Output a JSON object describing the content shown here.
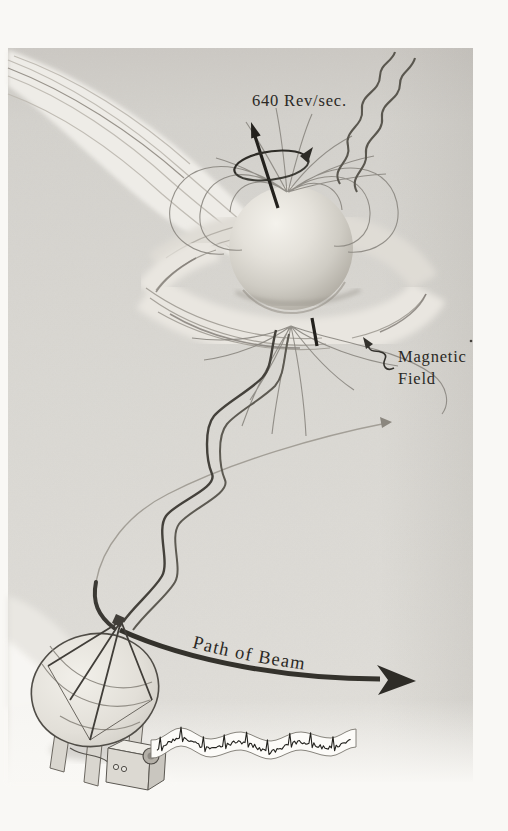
{
  "figure": {
    "labels": {
      "rotation_rate": "640 Rev/sec.",
      "magnetic_field_line1": "Magnetic",
      "magnetic_field_line2": "Field",
      "beam_path": "Path of Beam"
    },
    "recorder_trace": {
      "pulse_count": 9
    },
    "colors": {
      "paper": "#f9f8f5",
      "shading": "#d8d5d0",
      "pencil_dark": "#2d2b26",
      "pencil_mid": "#6b6760",
      "pencil_light": "#a6a29a",
      "ink_text": "#2b2925"
    },
    "icons": {
      "rotation_axis": "up-arrow",
      "rotation_direction": "elliptical-loop-arrow",
      "magnetic_field_pointer": "squiggle-arrow",
      "beam_path_arrow": "thick-curved-right-arrow",
      "beam_sweep_arc": "faint-arc-arrow",
      "radio_waves": "wavy-lines",
      "telescope": "parabolic-dish",
      "recorder": "chart-recorder-box",
      "signal_strip": "pulse-waveform-ribbon"
    }
  }
}
